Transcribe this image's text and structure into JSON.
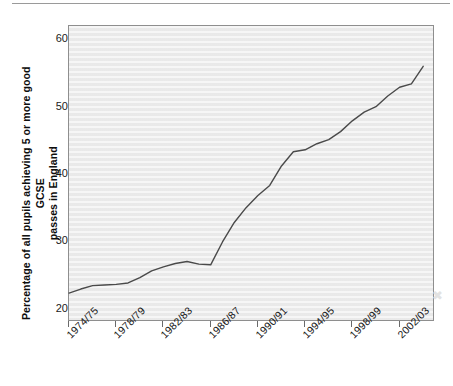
{
  "page": {
    "background_color": "#ffffff",
    "top_rule": "horizontal-rule"
  },
  "chart_data": {
    "type": "line",
    "title": "",
    "subtitle": "",
    "xlabel": "",
    "ylabel": "Percentage of all pupils achieving 5 or more good GCSE passes in England",
    "ylabel_line1": "Percentage of all pupils achieving 5 or more good GCSE",
    "ylabel_line2": "passes in England",
    "grid": false,
    "legend": "none",
    "plot_background_color": "#ececec",
    "line_color": "#4a4a4a",
    "xlim": [
      1974,
      2005
    ],
    "ylim": [
      18,
      62
    ],
    "y_ticks": [
      20,
      30,
      40,
      50,
      60
    ],
    "y_tick_labels": [
      "20",
      "30",
      "40",
      "50",
      "60"
    ],
    "x_ticks": [
      1974,
      1978,
      1982,
      1986,
      1990,
      1994,
      1998,
      2002
    ],
    "x_tick_labels": [
      "1974/75",
      "1978/79",
      "1982/83",
      "1986/87",
      "1990/91",
      "1994/95",
      "1998/99",
      "2002/03"
    ],
    "x": [
      1974,
      1975,
      1976,
      1977,
      1978,
      1979,
      1980,
      1981,
      1982,
      1983,
      1984,
      1985,
      1986,
      1987,
      1988,
      1989,
      1990,
      1991,
      1992,
      1993,
      1994,
      1995,
      1996,
      1997,
      1998,
      1999,
      2000,
      2001,
      2002,
      2003,
      2004
    ],
    "x_labels": [
      "1974/75",
      "1975/76",
      "1976/77",
      "1977/78",
      "1978/79",
      "1979/80",
      "1980/81",
      "1981/82",
      "1982/83",
      "1983/84",
      "1984/85",
      "1985/86",
      "1986/87",
      "1987/88",
      "1988/89",
      "1989/90",
      "1990/91",
      "1991/92",
      "1992/93",
      "1993/94",
      "1994/95",
      "1995/96",
      "1996/97",
      "1997/98",
      "1998/99",
      "1999/00",
      "2000/01",
      "2001/02",
      "2002/03",
      "2003/04",
      "2004/05"
    ],
    "values": [
      22.3,
      22.9,
      23.4,
      23.5,
      23.6,
      23.8,
      24.6,
      25.6,
      26.2,
      26.7,
      27.0,
      26.6,
      26.5,
      29.9,
      32.8,
      35.0,
      36.8,
      38.3,
      41.2,
      43.3,
      43.6,
      44.5,
      45.1,
      46.3,
      47.9,
      49.2,
      50.0,
      51.6,
      52.9,
      53.4,
      56.0
    ],
    "series": [
      {
        "name": "Percentage achieving 5+ good GCSE passes",
        "color": "#4a4a4a",
        "values": [
          22.3,
          22.9,
          23.4,
          23.5,
          23.6,
          23.8,
          24.6,
          25.6,
          26.2,
          26.7,
          27.0,
          26.6,
          26.5,
          29.9,
          32.8,
          35.0,
          36.8,
          38.3,
          41.2,
          43.3,
          43.6,
          44.5,
          45.1,
          46.3,
          47.9,
          49.2,
          50.0,
          51.6,
          52.9,
          53.4,
          56.0
        ]
      }
    ],
    "annotations": []
  }
}
